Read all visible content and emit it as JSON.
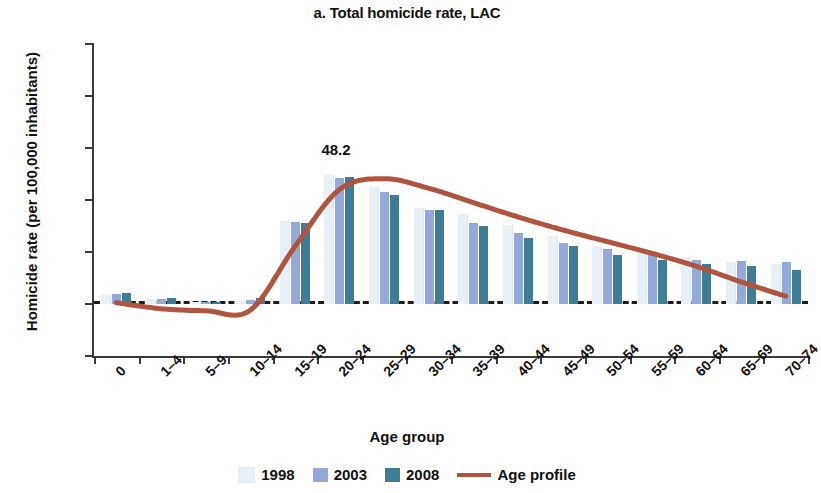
{
  "chart_data": {
    "type": "bar",
    "title": "a. Total homicide rate, LAC",
    "xlabel": "Age group",
    "ylabel": "Homicide rate (per 100,000 inhabitants)",
    "ylim": [
      -20,
      100
    ],
    "ytick_labels": [
      "100",
      "80",
      "60",
      "40",
      "20",
      "0",
      "−20"
    ],
    "ytick_values": [
      100,
      80,
      60,
      40,
      20,
      0,
      -20
    ],
    "grid": false,
    "legend_position": "bottom",
    "categories": [
      "0",
      "1–4",
      "5–9",
      "10–14",
      "15–19",
      "20–24",
      "25–29",
      "30–34",
      "35–39",
      "40–44",
      "45–49",
      "50–54",
      "55–59",
      "60–64",
      "65–69",
      "70–74"
    ],
    "series": [
      {
        "name": "1998",
        "color": "#e7eff7",
        "values": [
          3.5,
          1.8,
          0.6,
          1.2,
          31.8,
          49.5,
          45.0,
          37.0,
          34.5,
          30.5,
          26.0,
          22.5,
          20.5,
          18.0,
          16.0,
          15.5
        ]
      },
      {
        "name": "2003",
        "color": "#93a9d9",
        "values": [
          4.0,
          2.0,
          0.8,
          1.5,
          31.5,
          48.5,
          43.0,
          36.0,
          31.0,
          27.5,
          23.5,
          21.0,
          19.0,
          17.0,
          16.5,
          16.0
        ]
      },
      {
        "name": "2008",
        "color": "#3f7d96",
        "values": [
          4.2,
          2.2,
          0.9,
          2.4,
          31.0,
          49.0,
          42.0,
          36.0,
          30.0,
          25.5,
          22.5,
          19.0,
          17.0,
          15.5,
          14.5,
          13.0
        ]
      }
    ],
    "line_series": {
      "name": "Age profile",
      "color": "#b0543f",
      "values": [
        0.5,
        -1.8,
        -2.6,
        -2.4,
        22.0,
        44.0,
        48.2,
        44.5,
        39.0,
        33.5,
        28.5,
        24.0,
        19.5,
        14.5,
        8.5,
        3.0
      ]
    },
    "annotations": [
      {
        "text": "48.2",
        "category": "20–24",
        "value": 48.2
      }
    ]
  },
  "legend": {
    "entries": [
      {
        "label": "1998",
        "swatch": "s1998"
      },
      {
        "label": "2003",
        "swatch": "s2003"
      },
      {
        "label": "2008",
        "swatch": "s2008"
      },
      {
        "label": "Age profile",
        "swatch": "sline"
      }
    ]
  }
}
